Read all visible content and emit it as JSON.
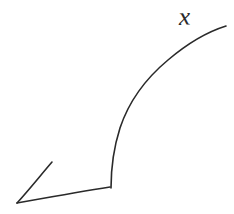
{
  "figure": {
    "background_color": "#ffffff",
    "stroke_color": "#2a2a2a",
    "stroke_width": 1.6,
    "width": 234,
    "height": 214,
    "label": {
      "text": "x",
      "x": 190,
      "y": 20
    }
  },
  "chart_data": {
    "type": "line",
    "title": "",
    "xlabel": "",
    "ylabel": "",
    "legend": [],
    "annotations": [
      {
        "text": "x",
        "x": 190,
        "y": 20
      }
    ],
    "grid": false,
    "xlim": [
      0,
      234
    ],
    "ylim": [
      214,
      0
    ],
    "series": [
      {
        "name": "rising-curve",
        "path": "M 111 188 C 111 170 113 150 120 128 C 128 104 144 80 168 60 C 188 43 210 31 226 26",
        "points": [
          {
            "x": 111,
            "y": 188
          },
          {
            "x": 112,
            "y": 168
          },
          {
            "x": 114,
            "y": 152
          },
          {
            "x": 120,
            "y": 130
          },
          {
            "x": 128,
            "y": 114
          },
          {
            "x": 136,
            "y": 100
          },
          {
            "x": 146,
            "y": 88
          },
          {
            "x": 160,
            "y": 70
          },
          {
            "x": 176,
            "y": 56
          },
          {
            "x": 194,
            "y": 44
          },
          {
            "x": 210,
            "y": 34
          },
          {
            "x": 226,
            "y": 26
          }
        ]
      },
      {
        "name": "baseline",
        "path": "M 17 203 C 45 198 78 192 110 187",
        "points": [
          {
            "x": 17,
            "y": 203
          },
          {
            "x": 50,
            "y": 197
          },
          {
            "x": 80,
            "y": 192
          },
          {
            "x": 110,
            "y": 187
          }
        ]
      },
      {
        "name": "arrow-upper-stroke",
        "path": "M 17 203 C 28 191 40 176 52 162",
        "points": [
          {
            "x": 17,
            "y": 203
          },
          {
            "x": 32,
            "y": 186
          },
          {
            "x": 52,
            "y": 162
          }
        ]
      }
    ]
  }
}
